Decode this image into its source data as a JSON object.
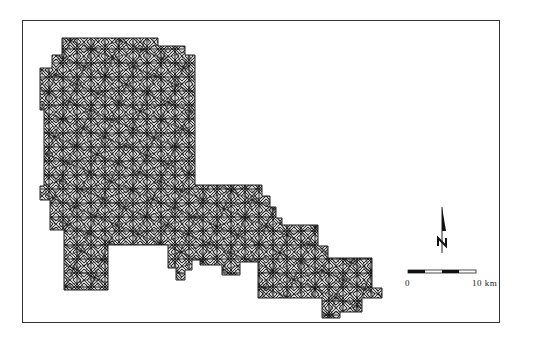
{
  "map": {
    "type": "triangulated mesh map",
    "mesh_color": "#1a1a1a",
    "background": "#ffffff"
  },
  "north_arrow": {
    "label": "N",
    "icon": "north-arrow-icon"
  },
  "scale_bar": {
    "start_label": "0",
    "end_label": "10 km",
    "segments": 4
  }
}
